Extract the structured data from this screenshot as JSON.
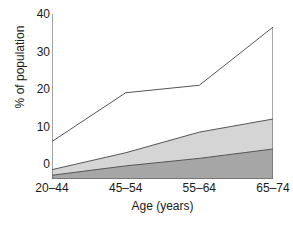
{
  "chart_data": {
    "type": "area",
    "title": "",
    "xlabel": "Age (years)",
    "ylabel": "% of population",
    "categories": [
      "20–44",
      "45–54",
      "55–64",
      "65–74"
    ],
    "ylim": [
      0,
      44
    ],
    "xlim": [
      0,
      3
    ],
    "yticks": [
      0,
      10,
      20,
      30,
      40
    ],
    "ytick_labels": [
      "0",
      "10",
      "20",
      "30",
      "40"
    ],
    "grid": false,
    "legend": "none",
    "stacked": true,
    "series": [
      {
        "name": "band-lower",
        "values": [
          1.0,
          3.5,
          5.5,
          8.0
        ],
        "cumulative": [
          1.0,
          3.5,
          5.5,
          8.0
        ],
        "fill": "#a6a6a6",
        "filled": true,
        "stroke": "#555555"
      },
      {
        "name": "band-middle",
        "values": [
          1.5,
          3.5,
          7.0,
          8.0
        ],
        "cumulative": [
          2.5,
          7.0,
          12.5,
          16.0
        ],
        "fill": "#d5d5d5",
        "filled": true,
        "stroke": "#555555"
      },
      {
        "name": "band-upper-outline",
        "values": [
          7.5,
          16.0,
          12.5,
          24.5
        ],
        "cumulative": [
          10.0,
          23.0,
          25.0,
          40.5
        ],
        "fill": "none",
        "filled": false,
        "stroke": "#555555"
      }
    ]
  },
  "axes": {
    "ylabel": "% of population",
    "xlabel": "Age (years)",
    "ytick_labels": [
      "40",
      "30",
      "20",
      "10",
      "0"
    ],
    "xtick_labels": [
      "20–44",
      "45–54",
      "55–64",
      "65–74"
    ],
    "axis_color": "#4d4d4d"
  },
  "colors": {
    "background": "#ffffff",
    "lower_band": "#a6a6a6",
    "middle_band": "#d5d5d5",
    "line": "#555555",
    "text": "#1a1a1a"
  }
}
